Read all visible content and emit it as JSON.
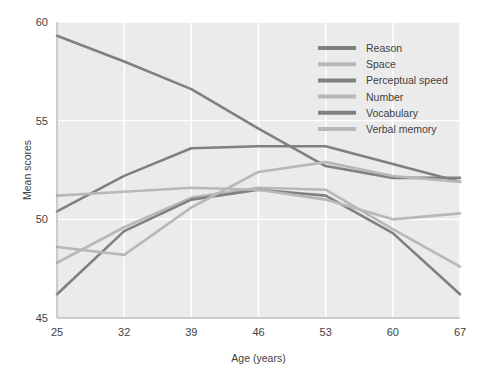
{
  "chart_data": {
    "type": "line",
    "title": "",
    "xlabel": "Age (years)",
    "ylabel": "Mean scores",
    "x": [
      25,
      32,
      39,
      46,
      53,
      60,
      67
    ],
    "categories": [
      "25",
      "32",
      "39",
      "46",
      "53",
      "60",
      "67"
    ],
    "xlim": [
      25,
      67
    ],
    "ylim": [
      45,
      60
    ],
    "yticks": [
      45,
      50,
      55,
      60
    ],
    "xticks": [
      25,
      32,
      39,
      46,
      53,
      60,
      67
    ],
    "grid": true,
    "legend_position": "upper right",
    "series": [
      {
        "name": "Reason",
        "color": "#808080",
        "values": [
          50.4,
          52.2,
          53.6,
          53.7,
          53.7,
          52.8,
          51.9
        ]
      },
      {
        "name": "Space",
        "color": "#b8b8b8",
        "values": [
          47.8,
          49.6,
          51.1,
          51.6,
          51.5,
          49.5,
          47.6
        ]
      },
      {
        "name": "Perceptual speed",
        "color": "#808080",
        "values": [
          46.2,
          49.4,
          51.0,
          51.5,
          51.2,
          49.3,
          46.2
        ]
      },
      {
        "name": "Number",
        "color": "#b8b8b8",
        "values": [
          51.2,
          51.4,
          51.6,
          51.5,
          51.0,
          50.0,
          50.3
        ]
      },
      {
        "name": "Vocabulary",
        "color": "#808080",
        "values": [
          59.3,
          58.0,
          56.6,
          54.6,
          52.7,
          52.1,
          52.1
        ]
      },
      {
        "name": "Verbal memory",
        "color": "#b8b8b8",
        "values": [
          48.6,
          48.2,
          50.6,
          52.4,
          52.9,
          52.2,
          51.9
        ]
      }
    ]
  },
  "axes": {
    "y_label": "Mean scores",
    "x_label": "Age (years)",
    "y_ticks": [
      "45",
      "50",
      "55",
      "60"
    ],
    "x_ticks": [
      "25",
      "32",
      "39",
      "46",
      "53",
      "60",
      "67"
    ]
  },
  "legend": {
    "items": [
      {
        "label": "Reason",
        "color": "#808080"
      },
      {
        "label": "Space",
        "color": "#b8b8b8"
      },
      {
        "label": "Perceptual speed",
        "color": "#808080"
      },
      {
        "label": "Number",
        "color": "#b8b8b8"
      },
      {
        "label": "Vocabulary",
        "color": "#808080"
      },
      {
        "label": "Verbal memory",
        "color": "#b8b8b8"
      }
    ]
  },
  "style": {
    "plot_background": "#ebebeb",
    "gridline_color": "#ffffff",
    "page_background": "#ffffff",
    "axis_text_color": "#3f3f3f",
    "line_width": 2.6
  }
}
